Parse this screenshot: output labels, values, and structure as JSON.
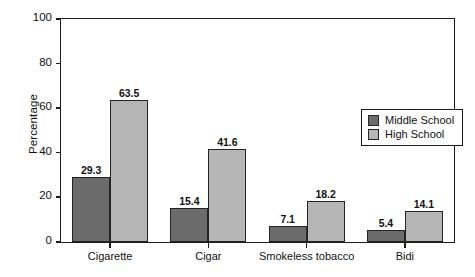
{
  "chart_data": {
    "type": "bar",
    "title": "",
    "subtitle": "",
    "xlabel": "",
    "ylabel": "Percentage",
    "categories": [
      "Cigarette",
      "Cigar",
      "Smokeless tobacco",
      "Bidi"
    ],
    "series": [
      {
        "name": "Middle School",
        "color": "#6b6b6b",
        "values": [
          29.3,
          15.4,
          7.1,
          5.4
        ],
        "labels": [
          "29.3",
          "15.4",
          "7.1",
          "5.4"
        ]
      },
      {
        "name": "High School",
        "color": "#b6b6b6",
        "values": [
          63.5,
          41.6,
          18.2,
          14.1
        ],
        "labels": [
          "63.5",
          "41.6",
          "18.2",
          "14.1"
        ]
      }
    ],
    "ylim": [
      0,
      100
    ],
    "ytick_values": [
      0,
      20,
      40,
      60,
      80,
      100
    ],
    "ytick_labels": [
      "0",
      "20",
      "40",
      "60",
      "80",
      "100"
    ],
    "grid": false,
    "legend_position": "upper right",
    "data_labels_shown": true,
    "bar_group_layout": "adjacent",
    "frame": "full-box"
  },
  "colors": {
    "middle_school": "#6b6b6b",
    "high_school": "#b6b6b6",
    "axis": "#1c1c1c",
    "text": "#111111",
    "background": "#ffffff"
  }
}
